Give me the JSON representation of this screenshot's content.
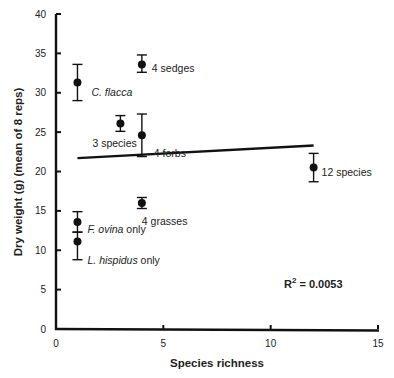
{
  "chart_data": {
    "type": "scatter",
    "title": "",
    "xlabel": "Species richness",
    "ylabel": "Dry weight (g) (mean of 8 reps)",
    "xlim": [
      0,
      15
    ],
    "ylim": [
      0,
      40
    ],
    "x_ticks": [
      0,
      5,
      10,
      15
    ],
    "y_ticks": [
      0,
      5,
      10,
      15,
      20,
      25,
      30,
      35,
      40
    ],
    "grid": false,
    "legend": null,
    "points": [
      {
        "label": "C. flacca",
        "italic_part": "C. flacca",
        "plain_part": "",
        "x": 1,
        "y": 31.3,
        "err_low": 29.0,
        "err_high": 33.6
      },
      {
        "label": "F. ovina only",
        "italic_part": "F. ovina",
        "plain_part": " only",
        "x": 1,
        "y": 13.6,
        "err_low": 12.3,
        "err_high": 14.9
      },
      {
        "label": "L. hispidus only",
        "italic_part": "L. hispidus",
        "plain_part": " only",
        "x": 1,
        "y": 11.1,
        "err_low": 8.8,
        "err_high": 12.3
      },
      {
        "label": "3 species",
        "italic_part": "",
        "plain_part": "3 species",
        "x": 3,
        "y": 26.1,
        "err_low": 25.1,
        "err_high": 27.1
      },
      {
        "label": "4 sedges",
        "italic_part": "",
        "plain_part": "4 sedges",
        "x": 4,
        "y": 33.6,
        "err_low": 32.6,
        "err_high": 34.8
      },
      {
        "label": "4 forbs",
        "italic_part": "",
        "plain_part": "4 forbs",
        "x": 4,
        "y": 24.6,
        "err_low": 21.9,
        "err_high": 27.3
      },
      {
        "label": "4 grasses",
        "italic_part": "",
        "plain_part": "4 grasses",
        "x": 4,
        "y": 16.0,
        "err_low": 15.3,
        "err_high": 16.7
      },
      {
        "label": "12 species",
        "italic_part": "",
        "plain_part": "12 species",
        "x": 12,
        "y": 20.5,
        "err_low": 18.7,
        "err_high": 22.3
      }
    ],
    "regression_line": {
      "x_start": 1,
      "y_start": 21.7,
      "x_end": 12,
      "y_end": 23.3
    },
    "annotations": [
      {
        "text": "R² = 0.0053",
        "x": 11,
        "y": 4.3
      }
    ]
  },
  "labels": {
    "x_axis_title": "Species richness",
    "y_axis_title": "Dry weight (g) (mean of 8 reps)",
    "r2_prefix": "R",
    "r2_sup": "2",
    "r2_value": " = 0.0053"
  }
}
